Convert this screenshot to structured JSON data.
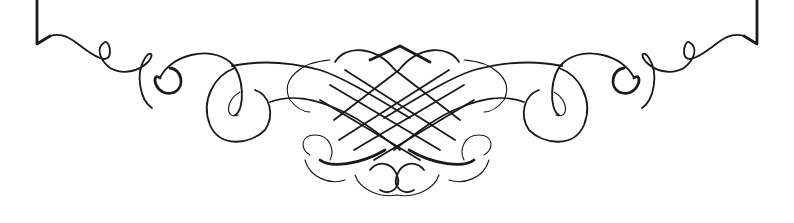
{
  "image": {
    "description": "Symmetric calligraphic flourish ornament with a bracket-like frame edge at top and an interlaced lattice knot in the center",
    "colors": {
      "background": "#ffffff",
      "ink": "#1a1a1a"
    }
  }
}
